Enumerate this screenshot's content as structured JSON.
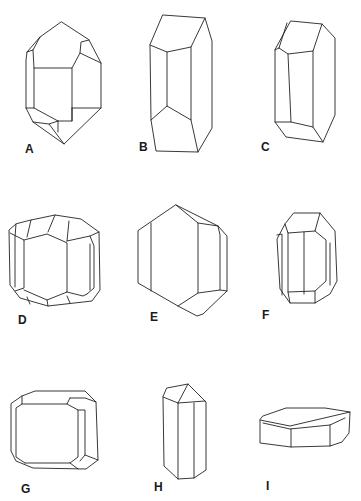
{
  "figure": {
    "line_color": "#222222",
    "background": "#ffffff",
    "panels": [
      {
        "id": "A",
        "label": "A",
        "habit": "doubly terminated prism with pyramidal faces"
      },
      {
        "id": "B",
        "label": "B",
        "habit": "elongated prism with pinacoid terminations"
      },
      {
        "id": "C",
        "label": "C",
        "habit": "elongated prism with beveled edges"
      },
      {
        "id": "D",
        "label": "D",
        "habit": "equant crystal with many truncated faces"
      },
      {
        "id": "E",
        "label": "E",
        "habit": "hexagonal-outline crystal with dome terminations"
      },
      {
        "id": "F",
        "label": "F",
        "habit": "short prism with beveled terminations"
      },
      {
        "id": "G",
        "label": "G",
        "habit": "tabular square crystal with truncated corners"
      },
      {
        "id": "H",
        "label": "H",
        "habit": "slender prism with low pyramidal cap"
      },
      {
        "id": "I",
        "label": "I",
        "habit": "flat tabular hexagonal plate"
      }
    ]
  }
}
